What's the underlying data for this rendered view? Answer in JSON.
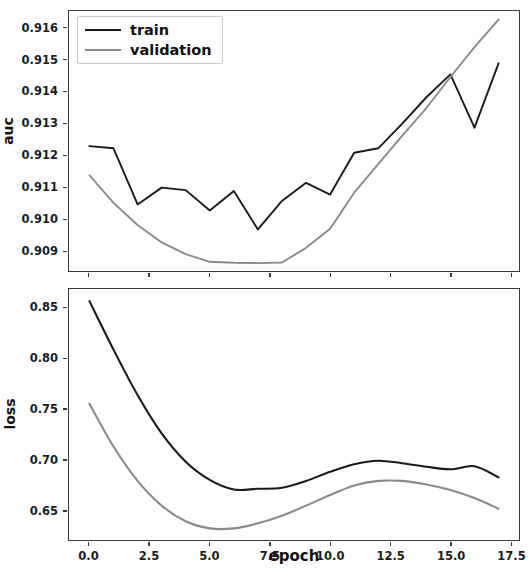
{
  "figure": {
    "background": "#ffffff",
    "frame_color": "#3a3a3a"
  },
  "legend": {
    "position": "upper-left-of-auc-axes",
    "entries": [
      {
        "label": "train",
        "color": "#1a1a1a"
      },
      {
        "label": "validation",
        "color": "#8a8a8a"
      }
    ]
  },
  "chart_data": [
    {
      "type": "line",
      "id": "auc-chart",
      "title": "",
      "xlabel": "",
      "ylabel": "auc",
      "xlim": [
        -0.85,
        17.85
      ],
      "ylim": [
        0.90835,
        0.91655
      ],
      "grid": false,
      "legend_position": "upper left",
      "xticks": [
        0.0,
        2.5,
        5.0,
        7.5,
        10.0,
        12.5,
        15.0,
        17.5
      ],
      "xticklabels": [
        "0.0",
        "2.5",
        "5.0",
        "7.5",
        "10.0",
        "12.5",
        "15.0",
        "17.5"
      ],
      "yticks": [
        0.909,
        0.91,
        0.911,
        0.912,
        0.913,
        0.914,
        0.915,
        0.916
      ],
      "yticklabels": [
        "0.909",
        "0.910",
        "0.911",
        "0.912",
        "0.913",
        "0.914",
        "0.915",
        "0.916"
      ],
      "x": [
        0,
        1,
        2,
        3,
        4,
        5,
        6,
        7,
        8,
        9,
        10,
        11,
        12,
        13,
        14,
        15,
        16,
        17
      ],
      "series": [
        {
          "name": "train",
          "color": "#1a1a1a",
          "linewidth": 1.9,
          "values": [
            0.91229,
            0.91222,
            0.91045,
            0.91098,
            0.9109,
            0.91026,
            0.91087,
            0.90966,
            0.91056,
            0.91113,
            0.91076,
            0.91208,
            0.91222,
            0.913,
            0.91383,
            0.91455,
            0.91287,
            0.9149
          ]
        },
        {
          "name": "validation",
          "color": "#8a8a8a",
          "linewidth": 1.9,
          "values": [
            0.91137,
            0.9105,
            0.9098,
            0.90925,
            0.90888,
            0.90864,
            0.90861,
            0.9086,
            0.90862,
            0.90908,
            0.90968,
            0.91082,
            0.91172,
            0.91262,
            0.91349,
            0.91447,
            0.91541,
            0.91628
          ]
        }
      ]
    },
    {
      "type": "line",
      "id": "loss-chart",
      "title": "",
      "xlabel": "epoch",
      "ylabel": "loss",
      "xlim": [
        -0.85,
        17.85
      ],
      "ylim": [
        0.6205,
        0.869
      ],
      "grid": false,
      "legend_position": "none",
      "xticks": [
        0.0,
        2.5,
        5.0,
        7.5,
        10.0,
        12.5,
        15.0,
        17.5
      ],
      "xticklabels": [
        "0.0",
        "2.5",
        "5.0",
        "7.5",
        "10.0",
        "12.5",
        "15.0",
        "17.5"
      ],
      "yticks": [
        0.65,
        0.7,
        0.75,
        0.8,
        0.85
      ],
      "yticklabels": [
        "0.65",
        "0.70",
        "0.75",
        "0.80",
        "0.85"
      ],
      "x": [
        0,
        1,
        2,
        3,
        4,
        5,
        6,
        7,
        8,
        9,
        10,
        11,
        12,
        13,
        14,
        15,
        16,
        17
      ],
      "series": [
        {
          "name": "train",
          "color": "#1a1a1a",
          "linewidth": 2.1,
          "values": [
            0.857,
            0.809,
            0.764,
            0.726,
            0.698,
            0.68,
            0.6705,
            0.6712,
            0.6722,
            0.679,
            0.688,
            0.6955,
            0.699,
            0.6965,
            0.693,
            0.6905,
            0.6935,
            0.6825
          ]
        },
        {
          "name": "validation",
          "color": "#8a8a8a",
          "linewidth": 2.1,
          "values": [
            0.7555,
            0.713,
            0.679,
            0.6545,
            0.639,
            0.632,
            0.632,
            0.637,
            0.6445,
            0.6545,
            0.665,
            0.6745,
            0.679,
            0.679,
            0.6755,
            0.67,
            0.662,
            0.6515
          ]
        }
      ]
    }
  ]
}
